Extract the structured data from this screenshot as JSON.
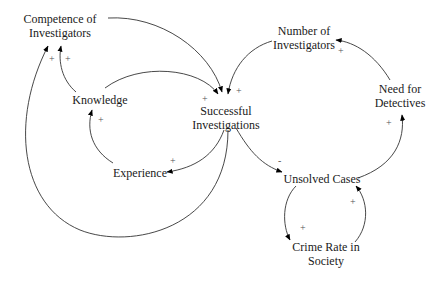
{
  "diagram": {
    "type": "causal-loop",
    "nodes": [
      {
        "id": "competence",
        "line1": "Competence of",
        "line2": "Investigators"
      },
      {
        "id": "knowledge",
        "line1": "Knowledge",
        "line2": ""
      },
      {
        "id": "successful",
        "line1": "Successful",
        "line2": "Investigations"
      },
      {
        "id": "experience",
        "line1": "Experience",
        "line2": ""
      },
      {
        "id": "number",
        "line1": "Number of",
        "line2": "Investigators"
      },
      {
        "id": "need",
        "line1": "Need for",
        "line2": "Detectives"
      },
      {
        "id": "unsolved",
        "line1": "Unsolved Cases",
        "line2": ""
      },
      {
        "id": "crime",
        "line1": "Crime Rate in",
        "line2": "Society"
      }
    ],
    "links": [
      {
        "from": "Knowledge",
        "to": "Competence of Investigators",
        "polarity": "+"
      },
      {
        "from": "Successful Investigations",
        "to": "Competence of Investigators",
        "polarity": "+"
      },
      {
        "from": "Competence of Investigators",
        "to": "Successful Investigations",
        "polarity": "+"
      },
      {
        "from": "Knowledge",
        "to": "Successful Investigations",
        "polarity": "+"
      },
      {
        "from": "Number of Investigators",
        "to": "Successful Investigations",
        "polarity": "+"
      },
      {
        "from": "Experience",
        "to": "Knowledge",
        "polarity": "+"
      },
      {
        "from": "Successful Investigations",
        "to": "Experience",
        "polarity": "+"
      },
      {
        "from": "Successful Investigations",
        "to": "Unsolved Cases",
        "polarity": "-"
      },
      {
        "from": "Unsolved Cases",
        "to": "Need for Detectives",
        "polarity": "+"
      },
      {
        "from": "Need for Detectives",
        "to": "Number of Investigators",
        "polarity": "+"
      },
      {
        "from": "Unsolved Cases",
        "to": "Crime Rate in Society",
        "polarity": "+"
      },
      {
        "from": "Crime Rate in Society",
        "to": "Unsolved Cases",
        "polarity": "+"
      }
    ],
    "polarity_labels": {
      "p1": "+",
      "p2": "+",
      "p3": "+",
      "p4": "+",
      "p5": "+",
      "p6": "+",
      "p7": "+",
      "p8": "-",
      "p9": "+",
      "p10": "+",
      "p11": "+",
      "p12": "+"
    }
  }
}
